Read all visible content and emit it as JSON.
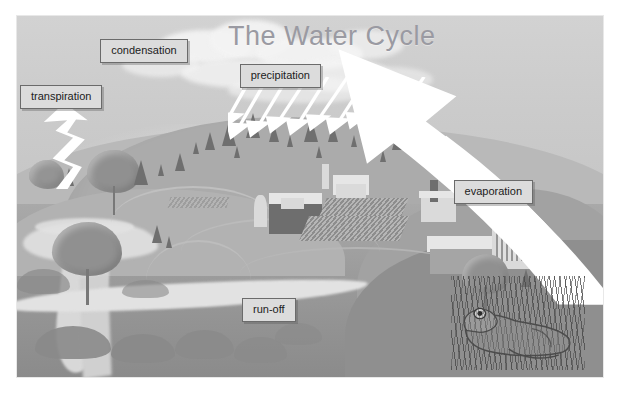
{
  "figure": {
    "title": "The Water Cycle",
    "title_color": "#9a9aa2",
    "background_color": "#ffffff",
    "plate_color": "#cacaca",
    "sky_color": "#cdcdcd",
    "ground_color": "#9f9f9f",
    "arrow_color": "#ffffff",
    "label_fill": "#dcdcdc",
    "label_border": "#6b6b6b",
    "label_text_color": "#1b1b1b"
  },
  "labels": [
    {
      "id": "condensation",
      "text": "condensation",
      "left_pct": 14.2,
      "top_pct": 6.4
    },
    {
      "id": "transpiration",
      "text": "transpiration",
      "left_pct": 0.5,
      "top_pct": 19.0
    },
    {
      "id": "precipitation",
      "text": "precipitation",
      "left_pct": 38.0,
      "top_pct": 13.3
    },
    {
      "id": "evaporation",
      "text": "evaporation",
      "left_pct": 74.5,
      "top_pct": 45.5
    },
    {
      "id": "run-off",
      "text": "run-off",
      "left_pct": 38.4,
      "top_pct": 78.0
    }
  ],
  "arrows": {
    "evaporation": {
      "name": "evaporation-arrow",
      "direction": "up-left",
      "style": "curved-sweep"
    },
    "transpiration": {
      "name": "transpiration-arrow",
      "direction": "up",
      "style": "zigzag"
    },
    "precipitation": {
      "name": "rain-streaks",
      "direction": "down-left",
      "count": 10
    }
  },
  "scene": {
    "sky": "overcast-sky",
    "clouds": "cloud-bank",
    "hill": "forested-hill",
    "farm": "farm-buildings-and-fields",
    "village": "village-buildings",
    "river": "river-and-stream",
    "lake": "lake",
    "frog": "frog-in-reeds",
    "trees": "trees"
  }
}
